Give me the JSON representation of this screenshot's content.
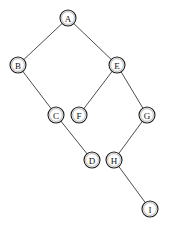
{
  "figure": {
    "title": "",
    "background_color": "#ffffff",
    "width": 171,
    "height": 228
  },
  "style": {
    "node_fill": "#ffffff",
    "node_stroke": "#1a1a1a",
    "node_radius": 8,
    "label_color": "#111111",
    "edge_color": "#4d4d4d",
    "edge_width": 1
  },
  "chart_data": {
    "type": "diagram",
    "subtype": "node-link-graph",
    "directed": false,
    "title": "",
    "xlabel": "",
    "ylabel": "",
    "grid": false,
    "legend": null,
    "nodes": [
      {
        "id": "A",
        "label": "A",
        "x": 68,
        "y": 18
      },
      {
        "id": "B",
        "label": "B",
        "x": 18,
        "y": 65
      },
      {
        "id": "E",
        "label": "E",
        "x": 117,
        "y": 65
      },
      {
        "id": "C",
        "label": "C",
        "x": 56,
        "y": 115
      },
      {
        "id": "F",
        "label": "F",
        "x": 79,
        "y": 115
      },
      {
        "id": "G",
        "label": "G",
        "x": 147,
        "y": 115
      },
      {
        "id": "D",
        "label": "D",
        "x": 92,
        "y": 160
      },
      {
        "id": "H",
        "label": "H",
        "x": 114,
        "y": 160
      },
      {
        "id": "I",
        "label": "I",
        "x": 150,
        "y": 209
      }
    ],
    "edges": [
      {
        "from": "A",
        "to": "B"
      },
      {
        "from": "A",
        "to": "E"
      },
      {
        "from": "B",
        "to": "C"
      },
      {
        "from": "E",
        "to": "F"
      },
      {
        "from": "E",
        "to": "G"
      },
      {
        "from": "C",
        "to": "D"
      },
      {
        "from": "G",
        "to": "H"
      },
      {
        "from": "H",
        "to": "I"
      }
    ]
  }
}
